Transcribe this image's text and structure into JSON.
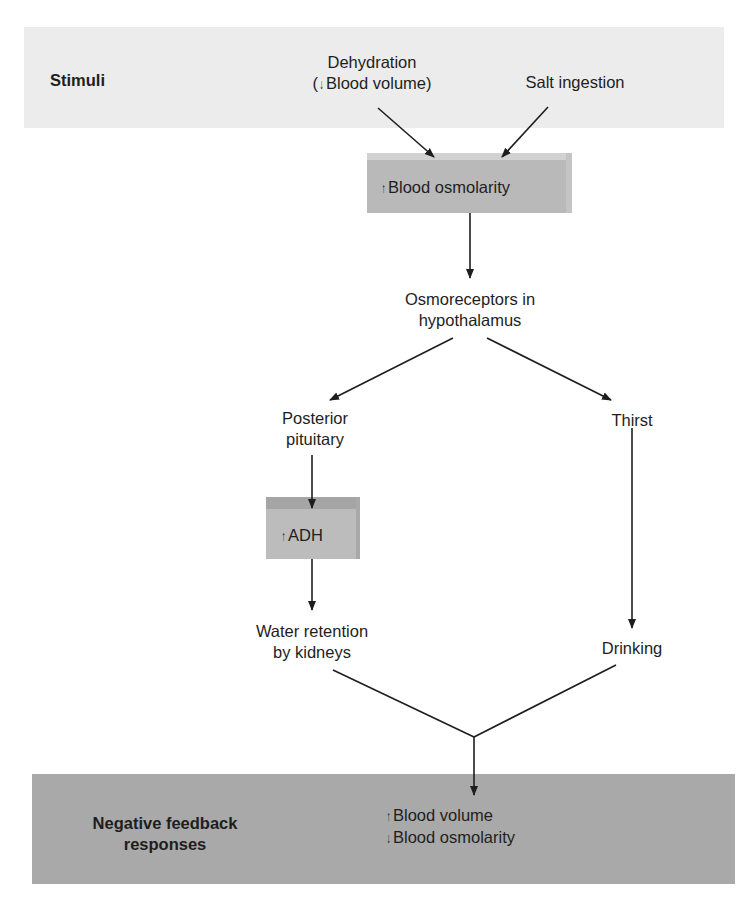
{
  "stimuli": {
    "title": "Stimuli",
    "dehydration": {
      "line1": "Dehydration",
      "line2_prefix": "(",
      "arrow": "↓",
      "line2": "Blood volume)"
    },
    "salt": "Salt ingestion"
  },
  "osmolarity_box": {
    "arrow": "↑",
    "label": "Blood osmolarity"
  },
  "osmoreceptors": {
    "line1": "Osmoreceptors in",
    "line2": "hypothalamus"
  },
  "left_branch": {
    "pituitary": {
      "line1": "Posterior",
      "line2": "pituitary"
    },
    "adh_box": {
      "arrow": "↑",
      "label": "ADH"
    },
    "water": {
      "line1": "Water retention",
      "line2": "by kidneys"
    }
  },
  "right_branch": {
    "thirst": "Thirst",
    "drinking": "Drinking"
  },
  "responses": {
    "title_line1": "Negative feedback",
    "title_line2": "responses",
    "result1": {
      "arrow": "↑",
      "label": "Blood volume"
    },
    "result2": {
      "arrow": "↓",
      "label": "Blood osmolarity"
    }
  },
  "colors": {
    "stimuli_band": "#ececec",
    "response_band": "#a9a9a9",
    "box_fill": "#b9b9b9",
    "line": "#1e1e1e"
  }
}
